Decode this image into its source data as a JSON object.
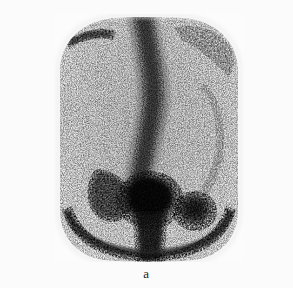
{
  "figure": {
    "caption": "a",
    "modality_label": "bone-scintigraphy",
    "background_color": "#fbfbfb",
    "image_ink_color": "#1a1a1a",
    "panel": {
      "left": 54,
      "top": 14,
      "width": 190,
      "height": 248
    }
  },
  "scan": {
    "view": "posterior",
    "body_outline": {
      "shape": "rounded-rectangle-with-domed-top-and-arched-bottom",
      "left": 6,
      "right": 186,
      "top": 4,
      "bottom": 246
    },
    "features": [
      {
        "name": "vertebral-column",
        "label": "Spine (thoracolumbar)",
        "intensity": "high",
        "cx": 101,
        "top": 6,
        "bottom": 168,
        "width": 26
      },
      {
        "name": "sacrum-bladder-focus",
        "label": "Central sacral / bladder uptake",
        "intensity": "very-high",
        "cx": 96,
        "cy": 186,
        "rx": 30,
        "ry": 26
      },
      {
        "name": "right-focal-lesion",
        "label": "Right iliac focal uptake",
        "intensity": "high",
        "cx": 141,
        "cy": 198,
        "rx": 18,
        "ry": 16
      },
      {
        "name": "left-paraspinal-streak",
        "label": "Left paraspinal / rib streak",
        "intensity": "medium",
        "cx": 58,
        "cy": 180,
        "rx": 20,
        "ry": 22
      },
      {
        "name": "left-upper-rib-streak",
        "label": "Left upper rib streak",
        "intensity": "medium-low",
        "cx": 35,
        "cy": 24,
        "rx": 22,
        "ry": 5
      },
      {
        "name": "pelvic-brim-arc",
        "label": "Pelvic brim arc",
        "intensity": "medium",
        "cx": 96,
        "cy": 212
      },
      {
        "name": "soft-tissue-background",
        "label": "Soft tissue background activity",
        "intensity": "low"
      }
    ]
  }
}
